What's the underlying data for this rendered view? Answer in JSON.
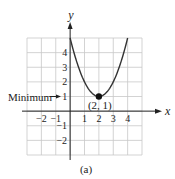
{
  "chart_data": {
    "type": "line",
    "title": "",
    "caption": "(a)",
    "xlabel": "x",
    "ylabel": "y",
    "xlim": [
      -3,
      5
    ],
    "ylim": [
      -3,
      5
    ],
    "grid": true,
    "x_ticks": [
      {
        "value": -2,
        "label": "−2"
      },
      {
        "value": -1,
        "label": "−1"
      },
      {
        "value": 1,
        "label": "1"
      },
      {
        "value": 2,
        "label": "2"
      },
      {
        "value": 3,
        "label": "3"
      },
      {
        "value": 4,
        "label": "4"
      }
    ],
    "y_ticks": [
      {
        "value": 4,
        "label": "4"
      },
      {
        "value": 3,
        "label": "3"
      },
      {
        "value": 2,
        "label": "2"
      },
      {
        "value": 1,
        "label": "1"
      },
      {
        "value": -1,
        "label": "−1"
      },
      {
        "value": -2,
        "label": "−2"
      }
    ],
    "series": [
      {
        "name": "parabola",
        "equation": "y = (x − 2)^2 + 1",
        "x": [
          0,
          0.5,
          1,
          1.5,
          2,
          2.5,
          3,
          3.5,
          4
        ],
        "y": [
          5,
          3.25,
          2,
          1.25,
          1,
          1.25,
          2,
          3.25,
          5
        ],
        "color": "#333333"
      }
    ],
    "points": [
      {
        "x": 2,
        "y": 1,
        "label": "(2, 1)"
      }
    ],
    "annotations": [
      {
        "text": "Minimum",
        "target": {
          "x": 0,
          "y": 1
        },
        "arrow": true
      }
    ]
  },
  "labels": {
    "x_axis": "x",
    "y_axis": "y",
    "point_label": "(2, 1)",
    "minimum_label": "Minimum",
    "caption": "(a)"
  },
  "colors": {
    "grid": "#c8c8c8",
    "axis": "#222222",
    "curve": "#333333",
    "point": "#111111"
  }
}
